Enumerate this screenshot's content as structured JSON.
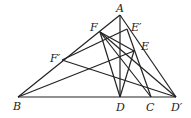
{
  "points": {
    "A": {
      "label": "A",
      "x": 120,
      "y": 15
    },
    "B": {
      "label": "B",
      "x": 18,
      "y": 97
    },
    "C": {
      "label": "C",
      "x": 151,
      "y": 97
    },
    "D": {
      "label": "D",
      "x": 120,
      "y": 97
    },
    "Dp": {
      "label": "D′",
      "x": 176,
      "y": 97
    },
    "E": {
      "label": "E",
      "x": 134,
      "y": 51
    },
    "Ep": {
      "label": "E′",
      "x": 127,
      "y": 29
    },
    "F": {
      "label": "F",
      "x": 100,
      "y": 32
    },
    "Fp": {
      "label": "F′",
      "x": 62,
      "y": 60
    }
  }
}
